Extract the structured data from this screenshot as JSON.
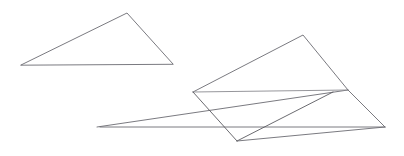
{
  "canvas": {
    "width": 404,
    "height": 156,
    "background_color": "#ffffff",
    "title": "Geometric line drawing"
  },
  "style": {
    "stroke_color": "#6b6b72",
    "stroke_color_dark": "#5a5a60",
    "stroke_color_faint": "#8a8a90",
    "stroke_width": 0.9,
    "fill": "none"
  },
  "chart_data": {
    "type": "line",
    "xlabel": "",
    "ylabel": "",
    "xlim": [
      0,
      404
    ],
    "ylim": [
      0,
      156
    ],
    "grid": false,
    "legend": "none",
    "series": [
      {
        "name": "small-triangle",
        "closed": true,
        "points": [
          [
            21,
            65
          ],
          [
            127,
            13
          ],
          [
            173,
            64
          ]
        ]
      },
      {
        "name": "large-baseline",
        "closed": false,
        "points": [
          [
            100,
            127
          ],
          [
            385,
            127
          ]
        ]
      },
      {
        "name": "long-diagonal-rise",
        "closed": false,
        "points": [
          [
            97,
            127
          ],
          [
            348,
            90
          ]
        ]
      },
      {
        "name": "upper-quadrilateral",
        "closed": false,
        "points": [
          [
            193,
            92
          ],
          [
            303,
            35
          ],
          [
            348,
            90
          ]
        ]
      },
      {
        "name": "inner-horizontal-chord",
        "closed": false,
        "points": [
          [
            193,
            92
          ],
          [
            348,
            90
          ]
        ]
      },
      {
        "name": "inner-quad-left-leg",
        "closed": false,
        "points": [
          [
            193,
            92
          ],
          [
            237,
            141
          ]
        ]
      },
      {
        "name": "inner-quad-right-leg",
        "closed": false,
        "points": [
          [
            237,
            141
          ],
          [
            333,
            92
          ]
        ]
      },
      {
        "name": "right-closing-edge",
        "closed": false,
        "points": [
          [
            348,
            90
          ],
          [
            385,
            127
          ]
        ]
      },
      {
        "name": "lower-baseline-right",
        "closed": false,
        "points": [
          [
            237,
            141
          ],
          [
            385,
            127
          ]
        ]
      }
    ]
  }
}
